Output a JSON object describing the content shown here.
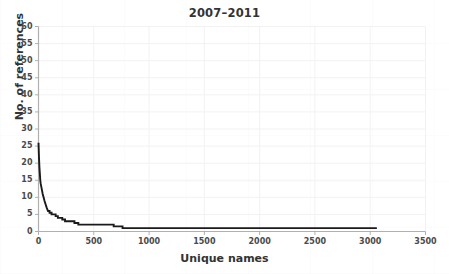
{
  "chart_data": {
    "type": "line",
    "title": "2007–2011",
    "xlabel": "Unique names",
    "ylabel": "No. of references",
    "xlim": [
      0,
      3500
    ],
    "ylim": [
      0,
      60
    ],
    "xticks": [
      0,
      500,
      1000,
      1500,
      2000,
      2500,
      3000,
      3500
    ],
    "yticks": [
      0,
      5,
      10,
      15,
      20,
      25,
      30,
      35,
      40,
      45,
      50,
      55,
      60
    ],
    "grid": true,
    "legend": "none",
    "line_color": "#1a1a1a",
    "axis_color": "#b0b0b0",
    "series": [
      {
        "name": "references per unique name (rank-ordered)",
        "x": [
          0,
          4,
          8,
          12,
          16,
          20,
          26,
          32,
          38,
          46,
          54,
          64,
          74,
          86,
          100,
          118,
          136,
          155,
          175,
          196,
          215,
          240,
          265,
          295,
          325,
          360,
          400,
          450,
          520,
          600,
          680,
          760,
          900,
          1100,
          1400,
          1800,
          2200,
          2600,
          3000,
          3060
        ],
        "y": [
          26,
          22,
          19,
          17,
          15,
          14,
          13,
          12,
          11,
          10,
          9,
          8,
          7,
          6,
          5.5,
          5,
          5,
          4.5,
          4,
          4,
          3.5,
          3,
          3,
          3,
          2.5,
          2,
          2,
          2,
          2,
          2,
          1.5,
          1,
          1,
          1,
          1,
          1,
          1,
          1,
          1,
          1
        ]
      }
    ],
    "annotations": {
      "max_references": 26,
      "max_unique_names": 3060
    }
  },
  "axis": {
    "ytick_labels": [
      "0",
      "5",
      "10",
      "15",
      "20",
      "25",
      "30",
      "35",
      "40",
      "45",
      "50",
      "55",
      "60"
    ],
    "xtick_labels": [
      "0",
      "500",
      "1000",
      "1500",
      "2000",
      "2500",
      "3000",
      "3500"
    ]
  }
}
